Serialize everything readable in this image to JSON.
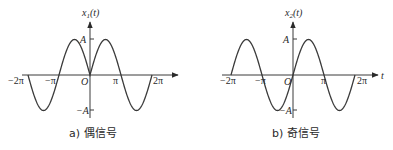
{
  "chart_data": [
    {
      "type": "line",
      "title": "",
      "caption": "a) 偶信号",
      "ylabel": "x₁(t)",
      "xlabel": "",
      "function": "A*sin(|t|)",
      "parity": "even",
      "x_range": [
        -6.2832,
        6.2832
      ],
      "ylim": [
        -1,
        1
      ],
      "x_ticks": [
        "-2π",
        "-π",
        "O",
        "π",
        "2π"
      ],
      "x_tick_values": [
        -6.2832,
        -3.1416,
        0,
        3.1416,
        6.2832
      ],
      "y_ticks": [
        "A",
        "-A"
      ],
      "y_tick_values": [
        1,
        -1
      ],
      "grid": false,
      "series": [
        {
          "name": "x1(t)",
          "x": [
            -6.2832,
            -4.7124,
            -3.1416,
            -1.5708,
            0,
            1.5708,
            3.1416,
            4.7124,
            6.2832
          ],
          "values": [
            0,
            -1,
            0,
            1,
            0,
            1,
            0,
            -1,
            0
          ]
        }
      ]
    },
    {
      "type": "line",
      "title": "",
      "caption": "b) 奇信号",
      "ylabel": "x₂(t)",
      "xlabel": "t",
      "function": "A*sin(t)",
      "parity": "odd",
      "x_range": [
        -6.2832,
        6.2832
      ],
      "ylim": [
        -1,
        1
      ],
      "x_ticks": [
        "-2π",
        "-π",
        "O",
        "π",
        "2π"
      ],
      "x_tick_values": [
        -6.2832,
        -3.1416,
        0,
        3.1416,
        6.2832
      ],
      "y_ticks": [
        "A",
        "-A"
      ],
      "y_tick_values": [
        1,
        -1
      ],
      "grid": false,
      "series": [
        {
          "name": "x2(t)",
          "x": [
            -6.2832,
            -4.7124,
            -3.1416,
            -1.5708,
            0,
            1.5708,
            3.1416,
            4.7124,
            6.2832
          ],
          "values": [
            0,
            1,
            0,
            -1,
            0,
            1,
            0,
            -1,
            0
          ]
        }
      ]
    }
  ],
  "left": {
    "ylabel_main": "x",
    "ylabel_sub": "1",
    "ylabel_arg": "(t)",
    "tick_neg2pi": "−2π",
    "tick_negpi": "−π",
    "origin": "O",
    "tick_pi": "π",
    "tick_2pi": "2π",
    "amp_pos": "A",
    "amp_neg": "−A",
    "caption": "a) 偶信号"
  },
  "right": {
    "ylabel_main": "x",
    "ylabel_sub": "2",
    "ylabel_arg": "(t)",
    "xlabel": "t",
    "tick_neg2pi": "−2π",
    "tick_negpi": "−π",
    "origin": "O",
    "tick_pi": "π",
    "tick_2pi": "2π",
    "amp_pos": "A",
    "amp_neg": "−A",
    "caption": "b) 奇信号"
  }
}
